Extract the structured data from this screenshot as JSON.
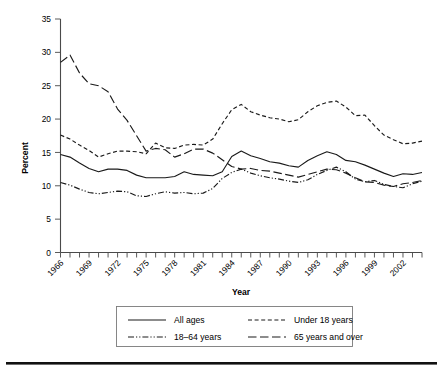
{
  "chart_data": {
    "type": "line",
    "title": "",
    "xlabel": "Year",
    "ylabel": "Percent",
    "xlim": [
      1966,
      2004
    ],
    "ylim": [
      0,
      35
    ],
    "yticks": [
      0,
      5,
      10,
      15,
      20,
      25,
      30,
      35
    ],
    "ytick_labels": [
      "0",
      "5",
      "10",
      "15",
      "20",
      "25",
      "30",
      "35"
    ],
    "x": [
      1966,
      1967,
      1968,
      1969,
      1970,
      1971,
      1972,
      1973,
      1974,
      1975,
      1976,
      1977,
      1978,
      1979,
      1980,
      1981,
      1982,
      1983,
      1984,
      1985,
      1986,
      1987,
      1988,
      1989,
      1990,
      1991,
      1992,
      1993,
      1994,
      1995,
      1996,
      1997,
      1998,
      1999,
      2000,
      2001,
      2002,
      2003,
      2004
    ],
    "xtick_labels": [
      "1966",
      "",
      "",
      "1969",
      "",
      "",
      "1972",
      "",
      "",
      "1975",
      "",
      "",
      "1978",
      "",
      "",
      "1981",
      "",
      "",
      "1984",
      "",
      "",
      "1987",
      "",
      "",
      "1990",
      "",
      "",
      "1993",
      "",
      "",
      "1996",
      "",
      "",
      "1999",
      "",
      "",
      "2002",
      "",
      ""
    ],
    "grid": false,
    "legend_position": "below",
    "series": [
      {
        "name": "All ages",
        "style": "solid",
        "values": [
          14.7,
          14.3,
          13.4,
          12.6,
          12.1,
          12.5,
          12.5,
          12.3,
          11.6,
          11.2,
          11.2,
          11.2,
          11.4,
          12.1,
          11.7,
          11.6,
          11.5,
          12.1,
          14.4,
          15.2,
          14.5,
          14.1,
          13.6,
          13.4,
          13.0,
          12.8,
          13.8,
          14.5,
          15.1,
          14.7,
          13.8,
          13.6,
          13.1,
          12.5,
          11.9,
          11.4,
          11.8,
          11.7,
          12.0
        ],
        "color": "#1a1a1a"
      },
      {
        "name": "Under 18 years",
        "style": "dashed",
        "values": [
          17.6,
          17.0,
          16.1,
          15.3,
          14.3,
          14.8,
          15.2,
          15.2,
          15.1,
          14.8,
          16.4,
          15.7,
          15.6,
          16.1,
          16.2,
          16.1,
          17.0,
          19.3,
          21.4,
          22.2,
          21.1,
          20.6,
          20.2,
          20.0,
          19.6,
          19.9,
          21.1,
          22.0,
          22.5,
          22.7,
          21.8,
          20.5,
          20.6,
          19.0,
          17.6,
          16.9,
          16.3,
          16.4,
          16.7
        ]
      },
      {
        "name": "18–64 years",
        "style": "dashdot",
        "values": [
          10.5,
          10.1,
          9.5,
          9.0,
          8.8,
          9.0,
          9.2,
          9.1,
          8.5,
          8.4,
          8.8,
          9.1,
          8.9,
          9.0,
          8.8,
          8.9,
          9.6,
          11.1,
          12.0,
          12.5,
          11.9,
          11.5,
          11.2,
          11.0,
          10.7,
          10.5,
          10.9,
          11.7,
          12.3,
          12.8,
          12.1,
          11.0,
          10.6,
          10.8,
          10.2,
          9.9,
          9.7,
          10.3,
          10.7
        ]
      },
      {
        "name": "65 years and over",
        "style": "longdash",
        "values": [
          28.5,
          29.6,
          26.9,
          25.3,
          25.0,
          24.1,
          21.5,
          19.8,
          17.5,
          15.2,
          15.6,
          15.4,
          14.3,
          14.8,
          15.5,
          15.5,
          14.9,
          13.9,
          12.9,
          12.5,
          12.6,
          12.3,
          12.2,
          11.9,
          11.6,
          11.3,
          11.7,
          12.1,
          12.5,
          12.4,
          11.9,
          11.2,
          10.6,
          10.5,
          10.1,
          9.9,
          10.3,
          10.5,
          10.8
        ]
      }
    ]
  },
  "legend": {
    "items": [
      {
        "label": "All ages",
        "style": "solid"
      },
      {
        "label": "Under 18 years",
        "style": "dashed"
      },
      {
        "label": "18–64 years",
        "style": "dashdot"
      },
      {
        "label": "65 years and over",
        "style": "longdash"
      }
    ]
  },
  "axes": {
    "x_title": "Year",
    "y_title": "Percent"
  }
}
